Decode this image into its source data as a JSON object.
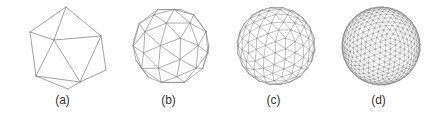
{
  "figure": {
    "background": "#ffffff",
    "line_color": "#8a8a8a",
    "panels": [
      {
        "id": "a",
        "label": "(a)",
        "left": 10,
        "subdivision": 0,
        "center": [
          56,
          48
        ],
        "radius": 40,
        "stroke_width": 0.8,
        "vertices": [
          [
            56,
            7
          ],
          [
            20,
            32
          ],
          [
            91,
            36
          ],
          [
            44,
            40
          ],
          [
            26,
            76
          ],
          [
            70,
            82
          ],
          [
            58,
            89
          ],
          [
            96,
            70
          ]
        ],
        "edges": [
          [
            0,
            1
          ],
          [
            0,
            2
          ],
          [
            0,
            3
          ],
          [
            1,
            3
          ],
          [
            2,
            3
          ],
          [
            1,
            4
          ],
          [
            3,
            4
          ],
          [
            3,
            5
          ],
          [
            2,
            5
          ],
          [
            4,
            5
          ],
          [
            4,
            6
          ],
          [
            5,
            6
          ],
          [
            2,
            7
          ],
          [
            5,
            7
          ]
        ]
      },
      {
        "id": "b",
        "label": "(b)",
        "left": 116,
        "subdivision": 1,
        "center": [
          55,
          46
        ],
        "radius": 39,
        "stroke_width": 0.7
      },
      {
        "id": "c",
        "label": "(c)",
        "left": 221,
        "subdivision": 2,
        "center": [
          55,
          46
        ],
        "radius": 39,
        "stroke_width": 0.55
      },
      {
        "id": "d",
        "label": "(d)",
        "left": 326,
        "subdivision": 3,
        "center": [
          55,
          46
        ],
        "radius": 39,
        "stroke_width": 0.45
      }
    ]
  }
}
